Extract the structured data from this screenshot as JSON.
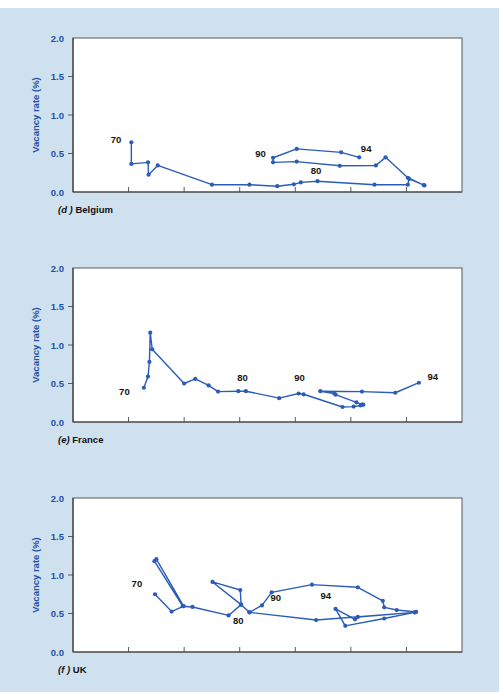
{
  "page": {
    "background_color": "#cfe0ef",
    "plot_background_color": "#ffffff",
    "accent_color": "#2a5cb8",
    "label_color": "#1b52a8"
  },
  "panels": [
    {
      "id": "belgium",
      "caption_prefix": "(d )",
      "caption_text": "Belgium"
    },
    {
      "id": "france",
      "caption_prefix": "(e)",
      "caption_text": "France"
    },
    {
      "id": "uk",
      "caption_prefix": "(f )",
      "caption_text": "UK"
    }
  ],
  "chart_data": [
    {
      "type": "line",
      "panel": "belgium",
      "title": "(d ) Belgium",
      "xlabel": "Unemployment rate (%)",
      "ylabel": "Vacancy rate (%)",
      "xlim": [
        0,
        14
      ],
      "ylim": [
        0,
        2.0
      ],
      "xticks": [
        0,
        2,
        4,
        6,
        8,
        10,
        12,
        14
      ],
      "xticklabels": [
        "0",
        "2",
        "4",
        "6",
        "8",
        "10",
        "12",
        "14"
      ],
      "yticks": [
        0.0,
        0.5,
        1.0,
        1.5,
        2.0
      ],
      "yticklabels": [
        "0.0",
        "0.5",
        "1.0",
        "1.5",
        "2.0"
      ],
      "grid": false,
      "legend": "none",
      "annotations": [
        {
          "text": "70",
          "x": 1.55,
          "y": 0.63
        },
        {
          "text": "80",
          "x": 8.75,
          "y": 0.23
        },
        {
          "text": "90",
          "x": 6.75,
          "y": 0.45
        },
        {
          "text": "94",
          "x": 10.55,
          "y": 0.52
        }
      ],
      "series": [
        {
          "name": "Belgium Beveridge curve 1970-1994",
          "points": [
            [
              2.1,
              0.645
            ],
            [
              2.1,
              0.365
            ],
            [
              2.7,
              0.385
            ],
            [
              2.72,
              0.225
            ],
            [
              3.05,
              0.345
            ],
            [
              5.0,
              0.095
            ],
            [
              6.35,
              0.095
            ],
            [
              7.35,
              0.075
            ],
            [
              7.95,
              0.1
            ],
            [
              8.2,
              0.125
            ],
            [
              8.8,
              0.14
            ],
            [
              10.85,
              0.095
            ],
            [
              12.05,
              0.095
            ],
            [
              12.1,
              0.17
            ],
            [
              12.65,
              0.085
            ],
            [
              12.62,
              0.09
            ],
            [
              12.05,
              0.185
            ],
            [
              11.25,
              0.45
            ],
            [
              10.9,
              0.345
            ],
            [
              9.6,
              0.34
            ],
            [
              8.05,
              0.395
            ],
            [
              7.2,
              0.385
            ],
            [
              7.2,
              0.445
            ],
            [
              8.05,
              0.56
            ],
            [
              9.65,
              0.515
            ],
            [
              10.3,
              0.45
            ]
          ]
        }
      ]
    },
    {
      "type": "line",
      "panel": "france",
      "title": "(e) France",
      "xlabel": "Unemployment rate (%)",
      "ylabel": "Vacancy rate (%)",
      "xlim": [
        0,
        14
      ],
      "ylim": [
        0,
        2.0
      ],
      "xticks": [
        0,
        2,
        4,
        6,
        8,
        10,
        12,
        14
      ],
      "xticklabels": [
        "0",
        "2",
        "4",
        "6",
        "8",
        "10",
        "12",
        "14"
      ],
      "yticks": [
        0.0,
        0.5,
        1.0,
        1.5,
        2.0
      ],
      "yticklabels": [
        "0.0",
        "0.5",
        "1.0",
        "1.5",
        "2.0"
      ],
      "grid": false,
      "legend": "none",
      "annotations": [
        {
          "text": "70",
          "x": 1.85,
          "y": 0.35
        },
        {
          "text": "80",
          "x": 6.1,
          "y": 0.53
        },
        {
          "text": "90",
          "x": 8.15,
          "y": 0.53
        },
        {
          "text": "94",
          "x": 12.95,
          "y": 0.54
        }
      ],
      "series": [
        {
          "name": "France Beveridge curve 1970-1994",
          "points": [
            [
              2.55,
              0.445
            ],
            [
              2.7,
              0.59
            ],
            [
              2.75,
              0.78
            ],
            [
              2.78,
              1.16
            ],
            [
              2.85,
              0.945
            ],
            [
              4.0,
              0.5
            ],
            [
              4.4,
              0.56
            ],
            [
              4.88,
              0.475
            ],
            [
              5.22,
              0.395
            ],
            [
              5.95,
              0.4
            ],
            [
              6.22,
              0.4
            ],
            [
              7.42,
              0.31
            ],
            [
              8.12,
              0.37
            ],
            [
              8.3,
              0.36
            ],
            [
              9.7,
              0.195
            ],
            [
              10.1,
              0.2
            ],
            [
              10.35,
              0.215
            ],
            [
              10.45,
              0.225
            ],
            [
              10.4,
              0.225
            ],
            [
              10.2,
              0.255
            ],
            [
              9.45,
              0.355
            ],
            [
              9.4,
              0.37
            ],
            [
              8.9,
              0.4
            ],
            [
              10.4,
              0.395
            ],
            [
              11.6,
              0.38
            ],
            [
              12.45,
              0.51
            ]
          ]
        }
      ]
    },
    {
      "type": "line",
      "panel": "uk",
      "title": "(f ) UK",
      "xlabel": "Unemployment rate (%)",
      "ylabel": "Vacancy rate (%)",
      "xlim": [
        0,
        14
      ],
      "ylim": [
        0,
        2.0
      ],
      "xticks": [
        0,
        2,
        4,
        6,
        8,
        10,
        12,
        14
      ],
      "xticklabels": [
        "0",
        "2",
        "4",
        "6",
        "8",
        "10",
        "12",
        "14"
      ],
      "yticks": [
        0.0,
        0.5,
        1.0,
        1.5,
        2.0
      ],
      "yticklabels": [
        "0.0",
        "0.5",
        "1.0",
        "1.5",
        "2.0"
      ],
      "grid": false,
      "legend": "none",
      "annotations": [
        {
          "text": "70",
          "x": 2.3,
          "y": 0.84
        },
        {
          "text": "80",
          "x": 5.95,
          "y": 0.36
        },
        {
          "text": "90",
          "x": 7.3,
          "y": 0.66
        },
        {
          "text": "94",
          "x": 9.1,
          "y": 0.69
        }
      ],
      "series": [
        {
          "name": "UK Beveridge curve 1970-1994",
          "points": [
            [
              2.95,
              0.75
            ],
            [
              3.55,
              0.525
            ],
            [
              3.98,
              0.595
            ],
            [
              3.0,
              1.205
            ],
            [
              2.93,
              1.18
            ],
            [
              3.95,
              0.595
            ],
            [
              4.3,
              0.585
            ],
            [
              5.6,
              0.475
            ],
            [
              6.05,
              0.615
            ],
            [
              6.02,
              0.805
            ],
            [
              5.02,
              0.91
            ],
            [
              6.05,
              0.615
            ],
            [
              6.35,
              0.515
            ],
            [
              6.8,
              0.605
            ],
            [
              7.15,
              0.775
            ],
            [
              8.6,
              0.875
            ],
            [
              10.25,
              0.84
            ],
            [
              11.15,
              0.665
            ],
            [
              11.2,
              0.58
            ],
            [
              11.65,
              0.545
            ],
            [
              12.35,
              0.52
            ],
            [
              12.3,
              0.515
            ],
            [
              10.25,
              0.455
            ],
            [
              10.15,
              0.425
            ],
            [
              9.45,
              0.56
            ],
            [
              9.8,
              0.34
            ],
            [
              11.2,
              0.435
            ],
            [
              12.3,
              0.515
            ],
            [
              8.75,
              0.415
            ],
            [
              6.35,
              0.515
            ]
          ]
        }
      ]
    }
  ]
}
